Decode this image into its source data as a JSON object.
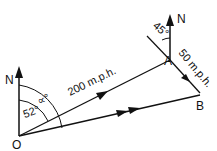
{
  "labels": {
    "north_o": "N",
    "north_a": "N",
    "origin": "O",
    "point_a": "A",
    "point_b": "B",
    "speed_oa": "200 m.p.h.",
    "speed_ab": "50 m.p.h.",
    "angle_alpha": "∝°",
    "angle_52": "52°",
    "angle_45": "45°"
  }
}
